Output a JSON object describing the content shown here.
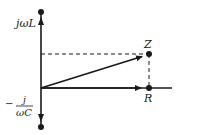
{
  "diagram": {
    "labels": {
      "inductive_axis": "jωL",
      "capacitive_numerator": "j",
      "capacitive_denominator": "ωC",
      "capacitive_sign": "−",
      "impedance_point": "Z",
      "resistance_point": "R"
    },
    "colors": {
      "line": "#1a1a1a",
      "background": "#ffffff"
    }
  }
}
